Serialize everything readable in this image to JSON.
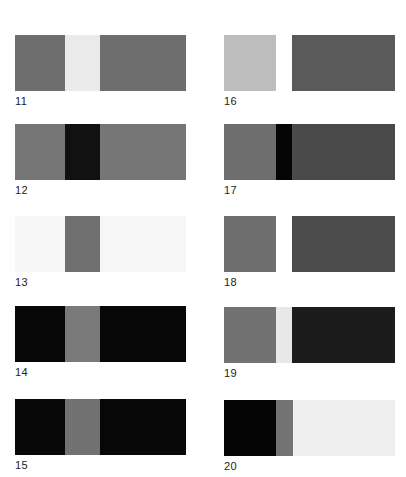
{
  "colors": {
    "mid_gray": "#6e6e6e",
    "dark_gray": "#4a4a4a",
    "light_gray": "#ebebeb",
    "silver": "#bdbdbd",
    "black": "#080808",
    "near_white": "#f5f5f5",
    "white": "#ffffff"
  },
  "swatches": [
    {
      "id": "11",
      "label": "11",
      "x": 15,
      "y": 35,
      "segments": [
        {
          "w": 50,
          "color": "#6e6e6e"
        },
        {
          "w": 35,
          "color": "#ebebeb"
        },
        {
          "w": 86,
          "color": "#6e6e6e"
        }
      ]
    },
    {
      "id": "12",
      "label": "12",
      "x": 15,
      "y": 124,
      "segments": [
        {
          "w": 50,
          "color": "#767676"
        },
        {
          "w": 35,
          "color": "#111111"
        },
        {
          "w": 86,
          "color": "#767676"
        }
      ]
    },
    {
      "id": "13",
      "label": "13",
      "x": 15,
      "y": 216,
      "segments": [
        {
          "w": 50,
          "color": "#f6f6f6"
        },
        {
          "w": 35,
          "color": "#707070"
        },
        {
          "w": 86,
          "color": "#f6f6f6"
        }
      ]
    },
    {
      "id": "14",
      "label": "14",
      "x": 15,
      "y": 306,
      "segments": [
        {
          "w": 50,
          "color": "#070707"
        },
        {
          "w": 35,
          "color": "#7a7a7a"
        },
        {
          "w": 86,
          "color": "#070707"
        }
      ]
    },
    {
      "id": "15",
      "label": "15",
      "x": 15,
      "y": 399,
      "segments": [
        {
          "w": 50,
          "color": "#070707"
        },
        {
          "w": 35,
          "color": "#727272"
        },
        {
          "w": 86,
          "color": "#070707"
        }
      ]
    },
    {
      "id": "16",
      "label": "16",
      "x": 224,
      "y": 35,
      "segments": [
        {
          "w": 52,
          "color": "#bdbdbd"
        },
        {
          "w": 16,
          "color": "#ffffff"
        },
        {
          "w": 103,
          "color": "#5a5a5a"
        }
      ]
    },
    {
      "id": "17",
      "label": "17",
      "x": 224,
      "y": 124,
      "segments": [
        {
          "w": 52,
          "color": "#6e6e6e"
        },
        {
          "w": 16,
          "color": "#050505"
        },
        {
          "w": 103,
          "color": "#4a4a4a"
        }
      ]
    },
    {
      "id": "18",
      "label": "18",
      "x": 224,
      "y": 216,
      "segments": [
        {
          "w": 52,
          "color": "#6e6e6e"
        },
        {
          "w": 16,
          "color": "#ffffff"
        },
        {
          "w": 103,
          "color": "#4c4c4c"
        }
      ]
    },
    {
      "id": "19",
      "label": "19",
      "x": 224,
      "y": 307,
      "segments": [
        {
          "w": 52,
          "color": "#727272"
        },
        {
          "w": 16,
          "color": "#e8e8e8"
        },
        {
          "w": 103,
          "color": "#1c1c1c"
        }
      ]
    },
    {
      "id": "20",
      "label": "20",
      "x": 224,
      "y": 400,
      "segments": [
        {
          "w": 52,
          "color": "#050505"
        },
        {
          "w": 17,
          "color": "#737373"
        },
        {
          "w": 102,
          "color": "#efefef"
        }
      ]
    }
  ]
}
